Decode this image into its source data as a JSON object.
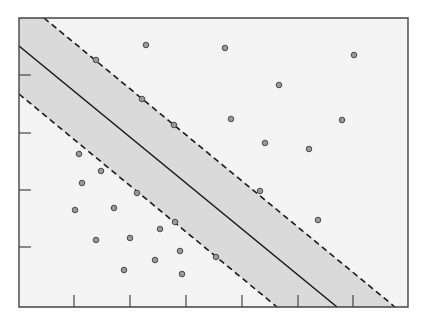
{
  "diagram": {
    "type": "svm-margin-illustration",
    "colors": {
      "background": "#ffffff",
      "plot_background": "#f4f4f4",
      "margin_band": "#dadada",
      "axis": "#444444",
      "hyperplane": "#1a1a1a",
      "margin_line": "#1a1a1a",
      "point_fill": "#9a9a9a",
      "point_stroke": "#4a4a4a"
    },
    "frame": {
      "left": 19,
      "top": 18,
      "right": 408,
      "bottom": 307
    },
    "x_ticks": [
      74,
      130,
      186,
      242,
      298,
      353
    ],
    "y_ticks": [
      75,
      133,
      190,
      247
    ],
    "hyperplane": {
      "x1": 19,
      "y1": 46,
      "x2": 337,
      "y2": 307
    },
    "margin_upper": {
      "x1": 44,
      "y1": 18,
      "x2": 395,
      "y2": 307
    },
    "margin_lower": {
      "x1": 19,
      "y1": 94,
      "x2": 277,
      "y2": 307
    },
    "points_class_upper": [
      [
        96,
        60
      ],
      [
        146,
        45
      ],
      [
        225,
        48
      ],
      [
        142,
        99
      ],
      [
        174,
        125
      ],
      [
        231,
        119
      ],
      [
        354,
        55
      ],
      [
        279,
        85
      ],
      [
        342,
        120
      ],
      [
        265,
        143
      ],
      [
        309,
        149
      ],
      [
        260,
        191
      ],
      [
        318,
        220
      ]
    ],
    "points_class_lower": [
      [
        79,
        154
      ],
      [
        101,
        171
      ],
      [
        82,
        183
      ],
      [
        75,
        210
      ],
      [
        96,
        240
      ],
      [
        137,
        193
      ],
      [
        114,
        208
      ],
      [
        175,
        222
      ],
      [
        160,
        229
      ],
      [
        130,
        238
      ],
      [
        180,
        251
      ],
      [
        155,
        260
      ],
      [
        216,
        257
      ],
      [
        124,
        270
      ],
      [
        182,
        274
      ]
    ]
  }
}
